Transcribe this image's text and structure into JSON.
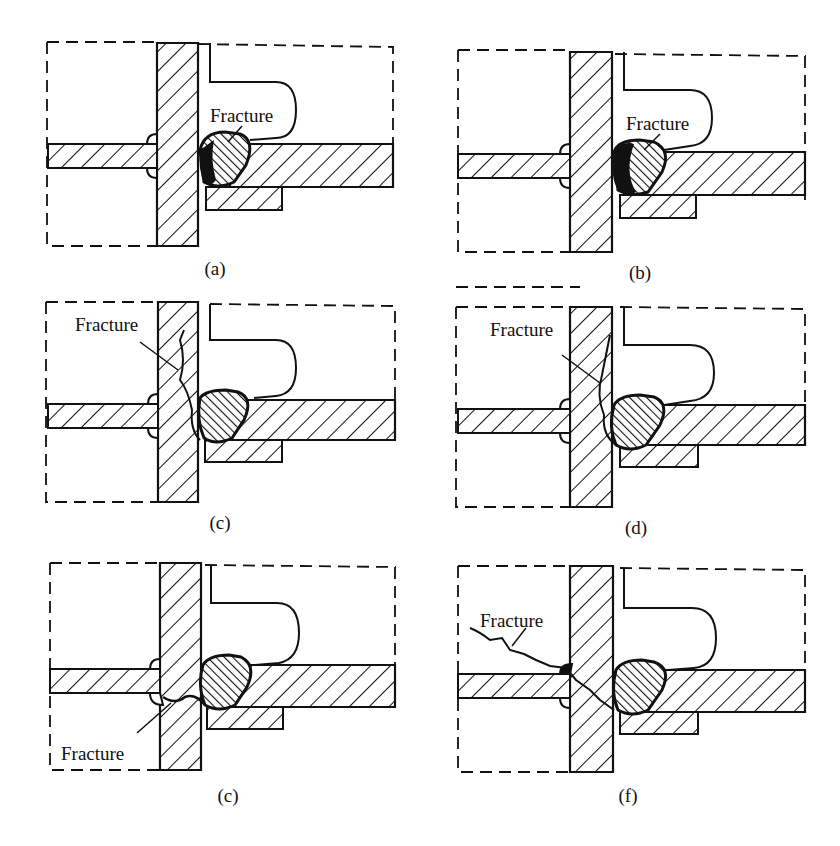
{
  "figure": {
    "colors": {
      "ink": "#111111",
      "background": "#ffffff"
    },
    "panels": [
      {
        "id": "a",
        "caption": "(a)",
        "fracture_label": "Fracture",
        "fracture_location": "through weld throat (right fillet weld)"
      },
      {
        "id": "b",
        "caption": "(b)",
        "fracture_label": "Fracture",
        "fracture_location": "weld fusion line (right fillet weld)"
      },
      {
        "id": "c",
        "caption": "(c)",
        "fracture_label": "Fracture",
        "fracture_location": "vertical plate heat-affected zone, upward"
      },
      {
        "id": "d",
        "caption": "(d)",
        "fracture_label": "Fracture",
        "fracture_location": "vertical plate, diagonal upward"
      },
      {
        "id": "e",
        "caption": "(c)",
        "fracture_label": "Fracture",
        "fracture_location": "vertical plate, between left and right welds"
      },
      {
        "id": "f",
        "caption": "(f)",
        "fracture_label": "Fracture",
        "fracture_location": "through vertical plate into left region"
      }
    ]
  }
}
